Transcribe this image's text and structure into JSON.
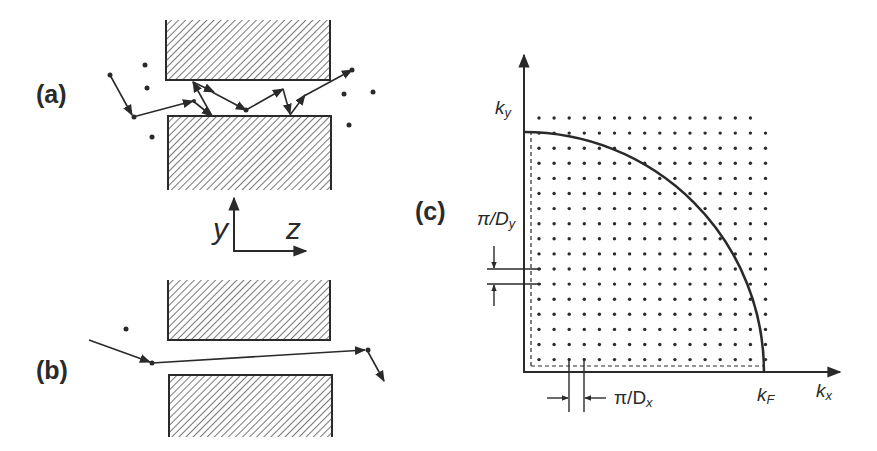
{
  "figure": {
    "panels": [
      {
        "id": "a",
        "label": "(a)",
        "description": "diffuse scattering of a trajectory between two hatched plates"
      },
      {
        "id": "b",
        "label": "(b)",
        "description": "near-ballistic trajectory passing between two hatched plates"
      },
      {
        "id": "c",
        "label": "(c)",
        "description": "quantized k-space lattice with Fermi circle quadrant"
      }
    ],
    "axes_ab": {
      "y_label": "y",
      "z_label": "z"
    },
    "kspace": {
      "ky_label": "k",
      "ky_sub": "y",
      "kx_label": "k",
      "kx_sub": "x",
      "kf_label": "k",
      "kf_sub": "F",
      "dy_label": "π/D",
      "dy_sub": "y",
      "dx_label": "π/D",
      "dx_sub": "x"
    },
    "colors": {
      "ink": "#2a2a2a",
      "hatch": "#555555",
      "background": "#ffffff"
    }
  }
}
